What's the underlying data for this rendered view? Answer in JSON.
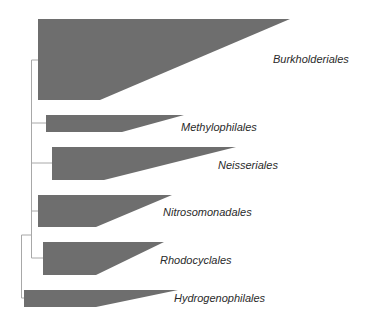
{
  "diagram": {
    "type": "collapsed phylogenetic tree",
    "colors": {
      "clade_fill": "#6e6e6e",
      "branch_line": "#a8a8a8",
      "label_text": "#2a2a2a"
    },
    "clades": [
      {
        "name": "Burkholderiales"
      },
      {
        "name": "Methylophilales"
      },
      {
        "name": "Neisseriales"
      },
      {
        "name": "Nitrosomonadales"
      },
      {
        "name": "Rhodocyclales"
      },
      {
        "name": "Hydrogenophilales"
      }
    ]
  }
}
